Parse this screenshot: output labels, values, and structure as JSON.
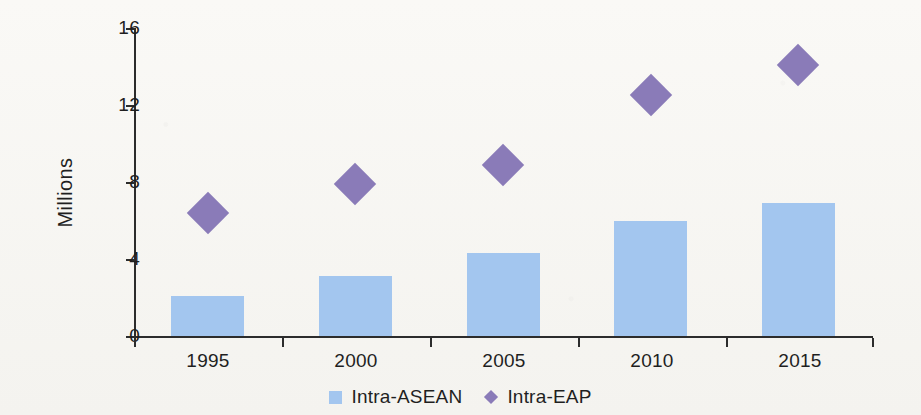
{
  "chart_data": {
    "type": "bar",
    "title": "",
    "subtitle": "",
    "xlabel": "",
    "ylabel": "Millions",
    "categories": [
      "1995",
      "2000",
      "2005",
      "2010",
      "2015"
    ],
    "ylim": [
      0,
      16
    ],
    "yticks": [
      0,
      4,
      8,
      12,
      16
    ],
    "ytick_labels": [
      "0",
      "4",
      "8",
      "12",
      "16"
    ],
    "grid": false,
    "legend_position": "bottom-center",
    "series": [
      {
        "name": "Intra-ASEAN",
        "type": "bar",
        "marker": "square",
        "color": "#a3c6ef",
        "values": [
          2.1,
          3.1,
          4.3,
          6.0,
          6.9
        ]
      },
      {
        "name": "Intra-EAP",
        "type": "scatter",
        "marker": "diamond",
        "color": "#8a7bb8",
        "values": [
          6.4,
          7.9,
          8.9,
          12.5,
          14.1
        ]
      }
    ]
  },
  "axes": {
    "y_title": "Millions",
    "y_tick_labels": [
      "16",
      "12",
      "8",
      "4",
      "0"
    ],
    "x_tick_labels": [
      "1995",
      "2000",
      "2005",
      "2010",
      "2015"
    ]
  },
  "legend": {
    "items": [
      {
        "label": "Intra-ASEAN",
        "marker": "square-marker",
        "color": "#a3c6ef"
      },
      {
        "label": "Intra-EAP",
        "marker": "diamond-marker",
        "color": "#8a7bb8"
      }
    ]
  },
  "colors": {
    "background": "#f7f6f3",
    "axis": "#2c2c2c",
    "bar": "#a3c6ef",
    "diamond": "#8a7bb8",
    "text": "#1f1f1f"
  }
}
